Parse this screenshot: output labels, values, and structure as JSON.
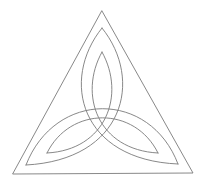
{
  "diagram": {
    "title": "",
    "stroke_color": "#7a7a7a",
    "background": "#ffffff",
    "triangle": {
      "apex": [
        102,
        11
      ],
      "left": [
        13,
        174
      ],
      "right": [
        193,
        173
      ]
    },
    "outer_loop_points": {
      "top": [
        102,
        28
      ],
      "left": [
        26,
        165
      ],
      "right": [
        178,
        164
      ]
    },
    "inner_loop_points": {
      "top": [
        102,
        52
      ],
      "left": [
        47,
        153
      ],
      "right": [
        158,
        153
      ]
    }
  }
}
